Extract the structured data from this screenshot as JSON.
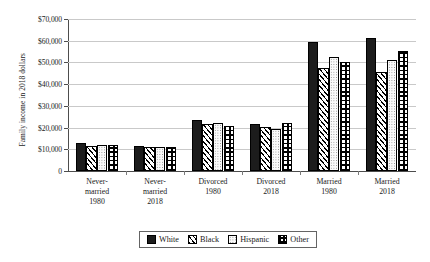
{
  "chart_data": {
    "type": "bar",
    "title": "",
    "xlabel": "",
    "ylabel": "Family income in 2018 dollars",
    "ylim": [
      0,
      70000
    ],
    "ytick_step": 10000,
    "grid": true,
    "legend_position": "bottom",
    "categories": [
      "Never-married 1980",
      "Never-married 2018",
      "Divorced 1980",
      "Divorced 2018",
      "Married 1980",
      "Married 2018"
    ],
    "category_lines": [
      [
        "Never-",
        "married",
        "1980"
      ],
      [
        "Never-",
        "married",
        "2018"
      ],
      [
        "Divorced",
        "1980",
        ""
      ],
      [
        "Divorced",
        "2018",
        ""
      ],
      [
        "Married",
        "1980",
        ""
      ],
      [
        "Married",
        "2018",
        ""
      ]
    ],
    "ytick_labels": [
      "$70,000",
      "$60,000",
      "$50,000",
      "$40,000",
      "$30,000",
      "$20,000",
      "$10,000",
      "0"
    ],
    "ytick_values": [
      70000,
      60000,
      50000,
      40000,
      30000,
      20000,
      10000,
      0
    ],
    "series": [
      {
        "name": "White",
        "pattern": "solid-black",
        "values": [
          12800,
          11400,
          23500,
          21800,
          59400,
          61200
        ]
      },
      {
        "name": "Black",
        "pattern": "diagonal-hatch",
        "values": [
          11500,
          11200,
          21700,
          20500,
          47600,
          45600
        ]
      },
      {
        "name": "Hispanic",
        "pattern": "light-dots",
        "values": [
          12200,
          10900,
          22300,
          19400,
          52700,
          51200
        ]
      },
      {
        "name": "Other",
        "pattern": "checkered",
        "values": [
          12200,
          11100,
          20900,
          22100,
          50200,
          55300
        ]
      }
    ]
  },
  "legend": {
    "items": [
      {
        "label": "White"
      },
      {
        "label": "Black"
      },
      {
        "label": "Hispanic"
      },
      {
        "label": "Other"
      }
    ]
  },
  "colors": {
    "white_series": "#1c1c1c",
    "gridline": "#c9c9c9",
    "axis": "#4d4d4d",
    "background": "#ffffff"
  }
}
